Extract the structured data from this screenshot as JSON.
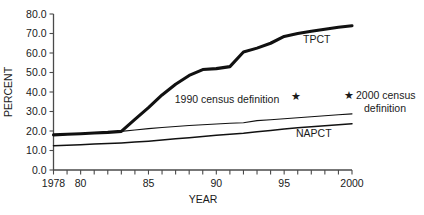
{
  "chart_data": {
    "type": "line",
    "title": "",
    "xlabel": "YEAR",
    "ylabel": "PERCENT",
    "xlim": [
      1978,
      2000
    ],
    "ylim": [
      0,
      80
    ],
    "grid": false,
    "legend": "inline-labels",
    "ytick_labels": [
      "0.0",
      "10.0",
      "20.0",
      "30.0",
      "40.0",
      "50.0",
      "60.0",
      "70.0",
      "80.0"
    ],
    "ytick_values": [
      0,
      10,
      20,
      30,
      40,
      50,
      60,
      70,
      80
    ],
    "xtick_labels": [
      "1978",
      "80",
      "85",
      "90",
      "95",
      "2000"
    ],
    "xtick_values": [
      1978,
      1980,
      1985,
      1990,
      1995,
      2000
    ],
    "x_minor_ticks": [
      1979,
      1981,
      1982,
      1983,
      1984,
      1986,
      1987,
      1988,
      1989,
      1991,
      1992,
      1993,
      1994,
      1996,
      1997,
      1998,
      1999
    ],
    "x": [
      1978,
      1979,
      1980,
      1981,
      1982,
      1983,
      1984,
      1985,
      1986,
      1987,
      1988,
      1989,
      1990,
      1991,
      1992,
      1993,
      1994,
      1995,
      1996,
      1997,
      1998,
      1999,
      2000
    ],
    "series": [
      {
        "name": "TPCT",
        "label": "TPCT",
        "style": "thick",
        "values": [
          18.0,
          18.3,
          18.6,
          19.0,
          19.3,
          19.8,
          26.0,
          32.0,
          38.5,
          44.0,
          48.5,
          51.5,
          52.0,
          53.0,
          60.5,
          62.5,
          65.0,
          68.5,
          70.0,
          71.2,
          72.2,
          73.2,
          74.0
        ]
      },
      {
        "name": "census-1990-definition",
        "label": "1990 census definition",
        "style": "thin",
        "values": [
          17.8,
          18.2,
          18.6,
          19.0,
          19.4,
          19.8,
          20.5,
          21.2,
          21.8,
          22.3,
          22.8,
          23.2,
          23.6,
          24.0,
          24.2,
          25.3,
          25.8,
          26.3,
          26.8,
          27.3,
          27.8,
          28.3,
          28.8
        ]
      },
      {
        "name": "NAPCT",
        "label": "NAPCT",
        "style": "medium",
        "values": [
          12.4,
          12.7,
          13.0,
          13.3,
          13.6,
          13.9,
          14.3,
          14.8,
          15.4,
          16.0,
          16.6,
          17.2,
          17.8,
          18.3,
          18.8,
          19.6,
          20.3,
          21.0,
          21.7,
          22.2,
          22.7,
          23.2,
          23.7
        ]
      }
    ],
    "annotations": [
      {
        "name": "census-2000-note",
        "marker": "★",
        "line1": "2000 census",
        "line2": "definition"
      },
      {
        "name": "census-1990-star-marker",
        "marker": "★"
      }
    ]
  }
}
